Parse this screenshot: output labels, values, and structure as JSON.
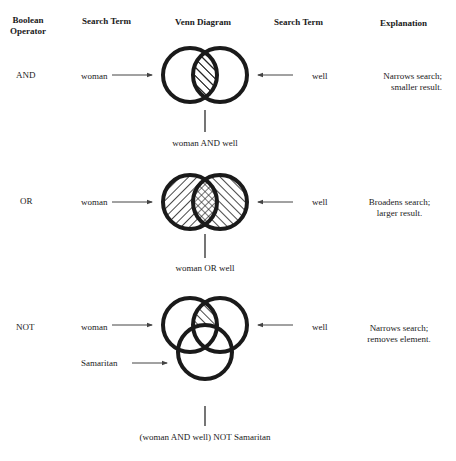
{
  "headers": {
    "operator": [
      "Boolean",
      "Operator"
    ],
    "search_term_left": "Search Term",
    "venn": "Venn Diagram",
    "search_term_right": "Search Term",
    "explanation": "Explanation"
  },
  "rows": [
    {
      "operator": "AND",
      "left_term": "woman",
      "right_term": "well",
      "result": "woman AND well",
      "explanation": [
        "Narrows search;",
        "smaller result."
      ],
      "shading": "intersection-hatched"
    },
    {
      "operator": "OR",
      "left_term": "woman",
      "right_term": "well",
      "result": "woman OR well",
      "explanation": [
        "Broadens search;",
        "larger result."
      ],
      "shading": "union-hatched-intersection-crosshatched"
    },
    {
      "operator": "NOT",
      "left_term": "woman",
      "right_term": "well",
      "third_term": "Samaritan",
      "result": "(woman AND well) NOT Samaritan",
      "explanation": [
        "Narrows search;",
        "removes element."
      ],
      "shading": "intersection-minus-third-hatched"
    }
  ],
  "colors": {
    "ink": "#1a1a1a",
    "arrow": "#444444",
    "background": "#ffffff"
  }
}
